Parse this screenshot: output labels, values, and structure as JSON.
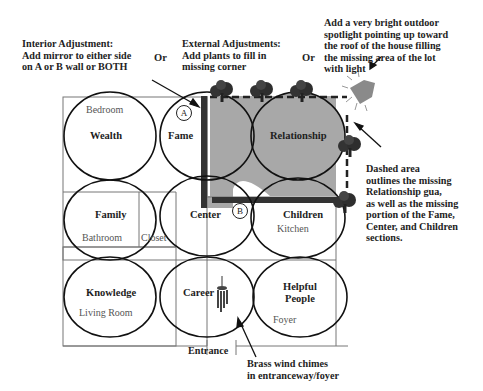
{
  "annotations": {
    "interior": "Interior Adjustment:\nAdd mirror to either side\non A or B wall or BOTH",
    "or_1": "Or",
    "external": "External Adjustments:\nAdd plants to fill in\nmissing corner",
    "or_2": "Or",
    "spotlight": "Add a very bright outdoor\nspotlight pointing up toward\nthe roof of the house filling\nthe missing area of the lot\nwith light",
    "dashed_area": "Dashed area\noutlines the missing\nRelationship gua,\nas well as the missing\nportion of the Fame,\nCenter, and Children\nsections.",
    "wind_chimes": "Brass wind chimes\nin entranceway/foyer",
    "entrance": "Entrance"
  },
  "markers": {
    "a": "A",
    "b": "B"
  },
  "guas": [
    {
      "id": "wealth",
      "label": "Wealth",
      "room": "Bedroom"
    },
    {
      "id": "fame",
      "label": "Fame",
      "room": ""
    },
    {
      "id": "relationship",
      "label": "Relationship",
      "room": ""
    },
    {
      "id": "family",
      "label": "Family",
      "room": "Bathroom"
    },
    {
      "id": "center",
      "label": "Center",
      "room": ""
    },
    {
      "id": "children",
      "label": "Children",
      "room": "Kitchen"
    },
    {
      "id": "knowledge",
      "label": "Knowledge",
      "room": "Living Room"
    },
    {
      "id": "career",
      "label": "Career",
      "room": ""
    },
    {
      "id": "helpful_people",
      "label": "Helpful\nPeople",
      "room": "Foyer"
    }
  ],
  "extra_rooms": {
    "closet": "Closet"
  },
  "colors": {
    "missing_area": "#a8a8a8",
    "wall": "#333333",
    "outline": "#111111"
  }
}
